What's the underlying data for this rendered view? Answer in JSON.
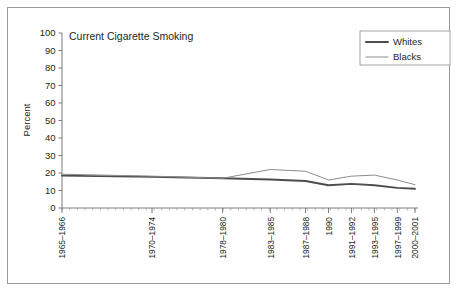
{
  "figure": {
    "background_color": "#ffffff",
    "border_color": "#9a9a9a",
    "title": "Current Cigarette Smoking"
  },
  "axes": {
    "ylabel": "Percent",
    "y_ticks": [
      "100",
      "90",
      "80",
      "70",
      "60",
      "50",
      "40",
      "30",
      "20",
      "10",
      "0"
    ],
    "x_ticks": [
      "1965–1966",
      "1970–1974",
      "1978–1980",
      "1983–1985",
      "1987–1988",
      "1990",
      "1991–1992",
      "1993–1995",
      "1997–1999",
      "2000–2001"
    ]
  },
  "legend": {
    "position": "top-right",
    "entries": [
      {
        "label": "Whites",
        "color": "#4d4d4d",
        "width": 2.0
      },
      {
        "label": "Blacks",
        "color": "#8c8c8c",
        "width": 1.0
      }
    ]
  },
  "chart_data": {
    "type": "line",
    "title": "Current Cigarette Smoking",
    "xlabel": "",
    "ylabel": "Percent",
    "ylim": [
      0,
      100
    ],
    "grid": false,
    "legend_position": "top-right",
    "categories": [
      "1965–1966",
      "1970–1974",
      "1978–1980",
      "1983–1985",
      "1987–1988",
      "1990",
      "1991–1992",
      "1993–1995",
      "1997–1999",
      "2000–2001"
    ],
    "series": [
      {
        "name": "Whites",
        "color": "#4d4d4d",
        "values": [
          18.5,
          17.8,
          17.0,
          16.3,
          15.4,
          13.0,
          13.8,
          13.0,
          11.5,
          11.0
        ]
      },
      {
        "name": "Blacks",
        "color": "#8c8c8c",
        "values": [
          19.3,
          18.2,
          17.0,
          22.0,
          21.0,
          16.0,
          18.2,
          18.8,
          16.0,
          13.3
        ]
      }
    ]
  }
}
